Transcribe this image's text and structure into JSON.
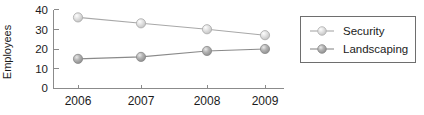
{
  "chart_data": {
    "type": "line",
    "title": "",
    "xlabel": "",
    "ylabel": "Employees",
    "categories": [
      "2006",
      "2007",
      "2008",
      "2009"
    ],
    "ylim": [
      0,
      40
    ],
    "yticks": [
      "0",
      "10",
      "20",
      "30",
      "40"
    ],
    "grid": false,
    "legend_position": "right-outside",
    "series": [
      {
        "name": "Security",
        "values": [
          36,
          33,
          30,
          27
        ],
        "color": "#cfcfcf",
        "line_color": "#a8a8a8"
      },
      {
        "name": "Landscaping",
        "values": [
          15,
          16,
          19,
          20
        ],
        "color": "#9a9a9a",
        "line_color": "#8a8a8a"
      }
    ]
  },
  "axes": {
    "y_title": "Employees",
    "y_tick_labels": [
      "40",
      "30",
      "20",
      "10",
      "0"
    ],
    "x_tick_labels": [
      "2006",
      "2007",
      "2008",
      "2009"
    ],
    "axis_color": "#8b8b8b"
  },
  "legend": {
    "items": [
      {
        "label": "Security",
        "marker_color": "#cfcfcf"
      },
      {
        "label": "Landscaping",
        "marker_color": "#9a9a9a"
      }
    ],
    "border_color": "#6e6e6e"
  }
}
